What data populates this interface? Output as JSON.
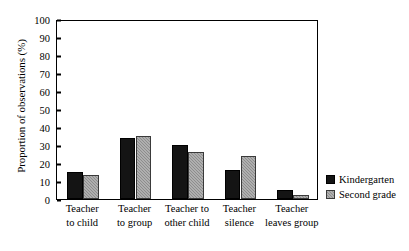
{
  "chart_data": {
    "type": "bar",
    "title": "",
    "xlabel": "",
    "ylabel": "Proportion of observations (%)",
    "ylim": [
      0,
      100
    ],
    "yticks": [
      0,
      10,
      20,
      30,
      40,
      50,
      60,
      70,
      80,
      90,
      100
    ],
    "ytick_labels": [
      "0",
      "10",
      "20",
      "30",
      "40",
      "50",
      "60",
      "70",
      "80",
      "90",
      "100"
    ],
    "grid": false,
    "legend_position": "right",
    "categories": [
      "Teacher to child",
      "Teacher to group",
      "Teacher to other child",
      "Teacher silence",
      "Teacher leaves group"
    ],
    "category_lines": [
      [
        "Teacher",
        "to child"
      ],
      [
        "Teacher",
        "to group"
      ],
      [
        "Teacher to",
        "other child"
      ],
      [
        "Teacher",
        "silence"
      ],
      [
        "Teacher",
        "leaves group"
      ]
    ],
    "series": [
      {
        "name": "Kindergarten",
        "color": "#141414",
        "values": [
          15,
          34,
          30,
          16,
          5
        ]
      },
      {
        "name": "Second grade",
        "color": "#8d8d8d",
        "values": [
          13.5,
          35,
          26,
          24,
          2
        ]
      }
    ]
  },
  "legend": {
    "items": [
      {
        "label": "Kindergarten"
      },
      {
        "label": "Second grade"
      }
    ]
  }
}
